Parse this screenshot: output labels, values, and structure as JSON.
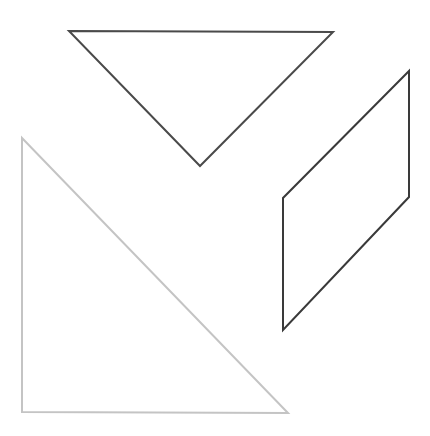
{
  "canvas": {
    "width": 430,
    "height": 436,
    "background_color": "#ffffff",
    "title": "geometric-shapes-outline-figure"
  },
  "shapes": [
    {
      "id": "inverted-triangle",
      "label": "Inverted triangle",
      "type": "triangle",
      "points": "69,31 333,32 200,166",
      "vertices": [
        [
          69,
          31
        ],
        [
          333,
          32
        ],
        [
          200,
          166
        ]
      ],
      "stroke_color": "#4a4a4a",
      "stroke_width": 2,
      "fill": "none"
    },
    {
      "id": "parallelogram",
      "label": "Parallelogram",
      "type": "parallelogram",
      "points": "409,71 409,197 283,330 283,198",
      "vertices": [
        [
          409,
          71
        ],
        [
          409,
          197
        ],
        [
          283,
          330
        ],
        [
          283,
          198
        ]
      ],
      "stroke_color": "#3a3a3a",
      "stroke_width": 2,
      "fill": "none"
    },
    {
      "id": "right-triangle",
      "label": "Right triangle",
      "type": "triangle",
      "points": "22,138 22,412 288,413",
      "vertices": [
        [
          22,
          138
        ],
        [
          22,
          412
        ],
        [
          288,
          413
        ]
      ],
      "stroke_color": "#c4c4c4",
      "stroke_width": 2,
      "fill": "none"
    }
  ]
}
